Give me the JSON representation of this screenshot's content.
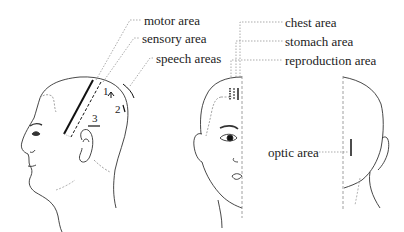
{
  "diagram": {
    "type": "scalp acupuncture areas illustration",
    "figures": [
      "side-view head",
      "front-view half face",
      "back-view half head"
    ],
    "labels": {
      "motor": "motor area",
      "sensory": "sensory area",
      "speech": "speech areas",
      "chest": "chest area",
      "stomach": "stomach area",
      "reproduction": "reproduction area",
      "optic": "optic area"
    },
    "speech_numbers": [
      "1",
      "2",
      "3"
    ],
    "colors": {
      "line": "#222222",
      "leader": "#888888",
      "background": "#ffffff"
    }
  }
}
